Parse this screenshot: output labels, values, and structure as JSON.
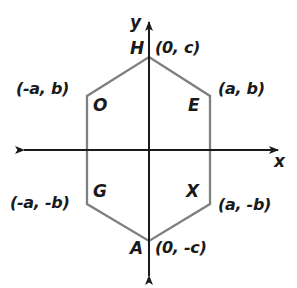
{
  "figure": {
    "background_color": "#ffffff",
    "axis_color": "#1a1a1a",
    "shape_color": "#808080",
    "label_color": "#1a1a1a"
  },
  "axes": {
    "y_label": "y",
    "x_label": "x",
    "origin": {
      "x": 149,
      "y": 150
    },
    "x_axis": {
      "start_x": 20,
      "end_x": 282,
      "y": 150
    },
    "y_axis": {
      "x": 149,
      "start_y": 18,
      "end_y": 280
    }
  },
  "polygon": {
    "sides": 6,
    "stroke_color": "#808080",
    "stroke_width": 2,
    "fill": "none",
    "vertices": [
      {
        "name": "H",
        "label": "H",
        "coord": "(0, c)",
        "px": 149,
        "py": 57
      },
      {
        "name": "E",
        "label": "E",
        "coord": "(a, b)",
        "px": 210,
        "py": 96
      },
      {
        "name": "X",
        "label": "X",
        "coord": "(a, -b)",
        "px": 210,
        "py": 204
      },
      {
        "name": "A",
        "label": "A",
        "coord": "(0, -c)",
        "px": 149,
        "py": 241
      },
      {
        "name": "G",
        "label": "G",
        "coord": "(-a, -b)",
        "px": 87,
        "py": 204
      },
      {
        "name": "O",
        "label": "O",
        "coord": "(-a, b)",
        "px": 87,
        "py": 96
      }
    ]
  },
  "labels": {
    "vertex_H": "H",
    "vertex_O": "O",
    "vertex_E": "E",
    "vertex_G": "G",
    "vertex_X": "X",
    "vertex_A": "A",
    "coord_H": "(0, c)",
    "coord_O": "(-a, b)",
    "coord_E": "(a, b)",
    "coord_G": "(-a, -b)",
    "coord_X": "(a, -b)",
    "coord_A": "(0, -c)"
  }
}
